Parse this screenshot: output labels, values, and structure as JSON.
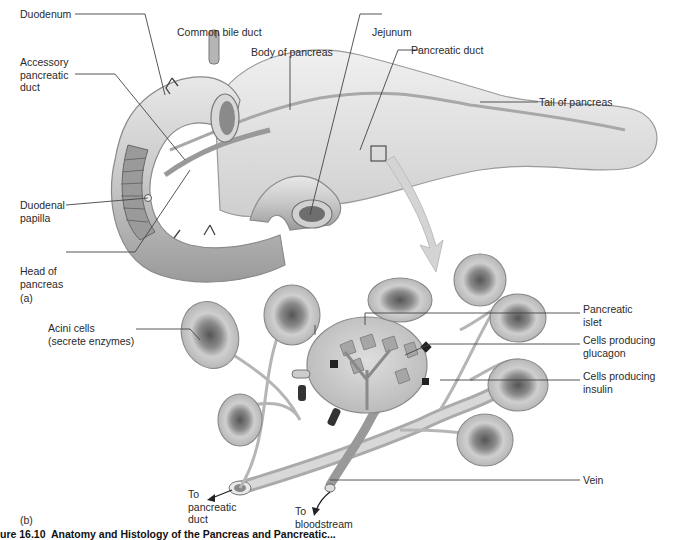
{
  "figure": {
    "panel_a": {
      "marker": "(a)",
      "labels": {
        "duodenum": "Duodenum",
        "accessory_pancreatic_duct": "Accessory\npancreatic\nduct",
        "common_bile_duct": "Common bile duct",
        "body_of_pancreas": "Body of pancreas",
        "jejunum": "Jejunum",
        "pancreatic_duct": "Pancreatic duct",
        "tail_of_pancreas": "Tail of pancreas",
        "duodenal_papilla": "Duodenal\npapilla",
        "head_of_pancreas": "Head of\npancreas"
      }
    },
    "panel_b": {
      "marker": "(b)",
      "labels": {
        "acini_cells": "Acini cells\n(secrete enzymes)",
        "pancreatic_islet": "Pancreatic\nislet",
        "cells_glucagon": "Cells producing\nglucagon",
        "cells_insulin": "Cells producing\ninsulin",
        "vein": "Vein",
        "to_pancreatic_duct": "To\npancreatic\nduct",
        "to_bloodstream": "To\nbloodstream"
      }
    },
    "caption": "ure 16.10  Anatomy and Histology of the Pancreas and Pancreatic..."
  },
  "colors": {
    "background": "#ffffff",
    "tissue_light": "#e6e6e6",
    "tissue_mid": "#c4c4c4",
    "tissue_dark": "#7a7a7a",
    "leader_line": "#444444",
    "text": "#2a2a2a"
  }
}
